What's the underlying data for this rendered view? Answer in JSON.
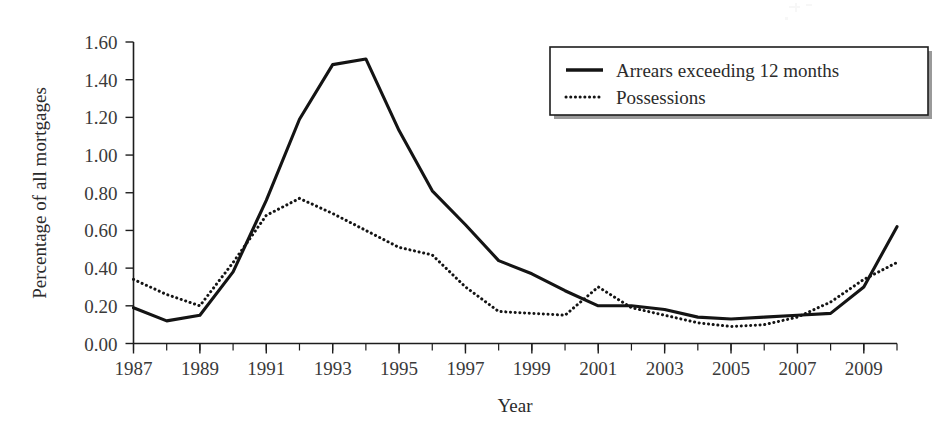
{
  "chart_data": {
    "type": "line",
    "title": "",
    "xlabel": "Year",
    "ylabel": "Percentage of all mortgages",
    "xlim": [
      1987,
      2010
    ],
    "ylim": [
      0.0,
      1.6
    ],
    "grid": false,
    "legend_position": "top-right",
    "x": [
      1987,
      1988,
      1989,
      1990,
      1991,
      1992,
      1993,
      1994,
      1995,
      1996,
      1997,
      1998,
      1999,
      2000,
      2001,
      2002,
      2003,
      2004,
      2005,
      2006,
      2007,
      2008,
      2009,
      2010
    ],
    "x_tick_labels": [
      "1987",
      "1989",
      "1991",
      "1993",
      "1995",
      "1997",
      "1999",
      "2001",
      "2003",
      "2005",
      "2007",
      "2009"
    ],
    "x_tick_values": [
      1987,
      1989,
      1991,
      1993,
      1995,
      1997,
      1999,
      2001,
      2003,
      2005,
      2007,
      2009
    ],
    "y_tick_labels": [
      "0.00",
      "0.20",
      "0.40",
      "0.60",
      "0.80",
      "1.00",
      "1.20",
      "1.40",
      "1.60"
    ],
    "y_tick_values": [
      0.0,
      0.2,
      0.4,
      0.6,
      0.8,
      1.0,
      1.2,
      1.4,
      1.6
    ],
    "series": [
      {
        "name": "Arrears exceeding 12 months",
        "style": "solid",
        "values": [
          0.19,
          0.12,
          0.15,
          0.38,
          0.76,
          1.19,
          1.48,
          1.51,
          1.13,
          0.81,
          0.63,
          0.44,
          0.37,
          0.28,
          0.2,
          0.2,
          0.18,
          0.14,
          0.13,
          0.14,
          0.15,
          0.16,
          0.3,
          0.62
        ]
      },
      {
        "name": "Possessions",
        "style": "dotted",
        "values": [
          0.34,
          0.26,
          0.2,
          0.43,
          0.68,
          0.77,
          0.69,
          0.6,
          0.51,
          0.47,
          0.3,
          0.17,
          0.16,
          0.15,
          0.3,
          0.19,
          0.15,
          0.11,
          0.09,
          0.1,
          0.14,
          0.22,
          0.34,
          0.43
        ]
      }
    ]
  },
  "legend": {
    "items": [
      {
        "label": "Arrears exceeding 12 months",
        "style": "solid"
      },
      {
        "label": "Possessions",
        "style": "dotted"
      }
    ]
  },
  "axes": {
    "x_title": "Year",
    "y_title": "Percentage of all mortgages"
  }
}
